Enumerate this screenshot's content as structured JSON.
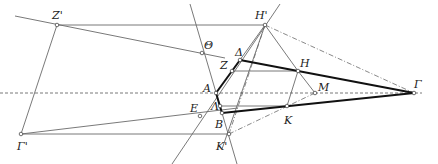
{
  "diagram": {
    "type": "geometric-construction",
    "colors": {
      "thin": "#6a6a6a",
      "thick": "#111111",
      "dashed": "#555555",
      "point_fill": "#ffffff"
    },
    "points": {
      "Zp": {
        "label": "Z'",
        "x": 57,
        "y": 25,
        "lx": 52,
        "ly": 10
      },
      "Hp": {
        "label": "H'",
        "x": 265,
        "y": 25,
        "lx": 255,
        "ly": 10
      },
      "Th": {
        "label": "Θ",
        "x": 202,
        "y": 53,
        "lx": 204,
        "ly": 40
      },
      "De": {
        "label": "Δ",
        "x": 240,
        "y": 60,
        "lx": 235,
        "ly": 47
      },
      "Z": {
        "label": "Z",
        "x": 232,
        "y": 71,
        "lx": 220,
        "ly": 60
      },
      "H": {
        "label": "H",
        "x": 298,
        "y": 71,
        "lx": 300,
        "ly": 58
      },
      "A": {
        "label": "A",
        "x": 216,
        "y": 93,
        "lx": 203,
        "ly": 83
      },
      "La": {
        "label": "Λ",
        "x": 220,
        "y": 106,
        "lx": 211,
        "ly": 101
      },
      "B": {
        "label": "B",
        "x": 222,
        "y": 113,
        "lx": 215,
        "ly": 119
      },
      "E": {
        "label": "E",
        "x": 200,
        "y": 116,
        "lx": 190,
        "ly": 103
      },
      "K": {
        "label": "K",
        "x": 287,
        "y": 106,
        "lx": 284,
        "ly": 115
      },
      "M": {
        "label": "M",
        "x": 315,
        "y": 93,
        "lx": 318,
        "ly": 82
      },
      "G": {
        "label": "Γ",
        "x": 414,
        "y": 93,
        "lx": 414,
        "ly": 79
      },
      "Gp": {
        "label": "Γ'",
        "x": 21,
        "y": 134,
        "lx": 17,
        "ly": 141
      },
      "Kp": {
        "label": "K'",
        "x": 229,
        "y": 134,
        "lx": 216,
        "ly": 141
      }
    },
    "segments_thin": [
      [
        57,
        25,
        265,
        25
      ],
      [
        15,
        16,
        225,
        58
      ],
      [
        57,
        25,
        21,
        134
      ],
      [
        21,
        134,
        229,
        134
      ],
      [
        21,
        134,
        238,
        108
      ],
      [
        232,
        71,
        298,
        71
      ],
      [
        220,
        106,
        287,
        106
      ],
      [
        298,
        71,
        287,
        106
      ],
      [
        298,
        71,
        315,
        93
      ],
      [
        190,
        4,
        237,
        164
      ],
      [
        280,
        4,
        172,
        164
      ],
      [
        265,
        25,
        222,
        149
      ],
      [
        265,
        25,
        298,
        71
      ],
      [
        232,
        71,
        265,
        25
      ]
    ],
    "segments_dashdot": [
      [
        265,
        25,
        414,
        93
      ],
      [
        229,
        134,
        315,
        93
      ],
      [
        265,
        25,
        229,
        134
      ]
    ],
    "segments_thick": [
      [
        240,
        60,
        414,
        93
      ],
      [
        222,
        113,
        414,
        93
      ],
      [
        240,
        60,
        216,
        93
      ],
      [
        216,
        93,
        222,
        113
      ]
    ],
    "dashed_axis": [
      0,
      93,
      422,
      93
    ]
  }
}
